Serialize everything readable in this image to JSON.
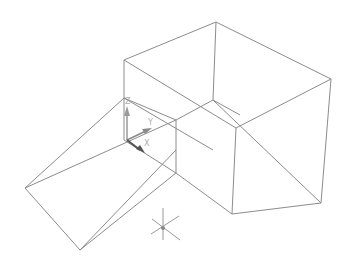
{
  "viewport": {
    "background": "#ffffff",
    "edge_color": "#8c8c8c"
  },
  "ucs_icon": {
    "labels": {
      "z": "Z",
      "y": "Y",
      "x": "X"
    },
    "colors": {
      "z": "#9a9a9a",
      "y": "#8a8a8a",
      "x": "#555555"
    }
  },
  "pivot_gizmo": {
    "color": "#9a9a9a"
  },
  "objects": [
    {
      "name": "box",
      "type": "wireframe-box"
    },
    {
      "name": "wedge",
      "type": "wireframe-wedge"
    }
  ]
}
